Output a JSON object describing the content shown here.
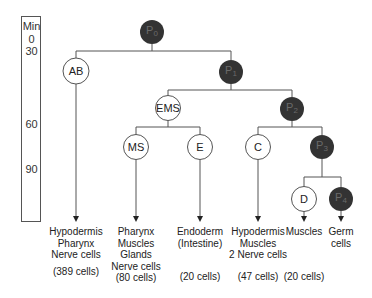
{
  "time_axis": {
    "unit_label": "Min",
    "ticks": [
      {
        "label": "0",
        "y": 33
      },
      {
        "label": "30",
        "y": 45
      },
      {
        "label": "60",
        "y": 118
      },
      {
        "label": "90",
        "y": 163
      }
    ]
  },
  "nodes": {
    "P0": {
      "name": "P",
      "sub": "0",
      "type": "germline",
      "cx": 152,
      "cy": 32
    },
    "AB": {
      "name": "AB",
      "sub": "",
      "type": "somatic",
      "cx": 76,
      "cy": 71
    },
    "P1": {
      "name": "P",
      "sub": "1",
      "type": "germline",
      "cx": 231,
      "cy": 72
    },
    "EMS": {
      "name": "EMS",
      "sub": "",
      "type": "somatic",
      "cx": 168,
      "cy": 108
    },
    "P2": {
      "name": "P",
      "sub": "2",
      "type": "germline",
      "cx": 292,
      "cy": 109
    },
    "MS": {
      "name": "MS",
      "sub": "",
      "type": "somatic",
      "cx": 136,
      "cy": 147
    },
    "E": {
      "name": "E",
      "sub": "",
      "type": "somatic",
      "cx": 200,
      "cy": 147
    },
    "C": {
      "name": "C",
      "sub": "",
      "type": "somatic",
      "cx": 258,
      "cy": 147
    },
    "P3": {
      "name": "P",
      "sub": "3",
      "type": "germline",
      "cx": 322,
      "cy": 147
    },
    "D": {
      "name": "D",
      "sub": "",
      "type": "somatic",
      "cx": 304,
      "cy": 199
    },
    "P4": {
      "name": "P",
      "sub": "4",
      "type": "germline",
      "cx": 341,
      "cy": 199
    }
  },
  "fates": [
    {
      "lineage": "AB",
      "x": 76,
      "lines": [
        "Hypodermis",
        "Pharynx",
        "Nerve cells"
      ],
      "count": "(389 cells)"
    },
    {
      "lineage": "MS",
      "x": 136,
      "lines": [
        "Pharynx",
        "Muscles",
        "Glands",
        "Nerve cells"
      ],
      "count": "(80 cells)"
    },
    {
      "lineage": "E",
      "x": 200,
      "lines": [
        "Endoderm",
        "(Intestine)"
      ],
      "count": "(20 cells)"
    },
    {
      "lineage": "C",
      "x": 258,
      "lines": [
        "Hypodermis",
        "Muscles",
        "2 Nerve cells"
      ],
      "count": "(47 cells)"
    },
    {
      "lineage": "D",
      "x": 304,
      "lines": [
        "Muscles"
      ],
      "count": "(20 cells)"
    },
    {
      "lineage": "P4",
      "x": 341,
      "lines": [
        "Germ",
        "cells"
      ],
      "count": ""
    }
  ],
  "colors": {
    "germline_fill": "#333333",
    "germline_text": "#6a6a6a",
    "somatic_fill": "#ffffff",
    "line": "#555555"
  }
}
